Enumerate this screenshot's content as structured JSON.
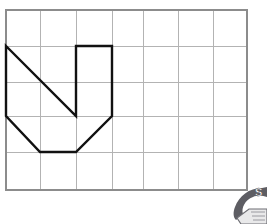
{
  "figure": {
    "title": "",
    "background_color": "#ffffff",
    "grid": {
      "name": "square-grid",
      "columns": 7,
      "rows": 5,
      "cell_width": 34.4,
      "cell_height": 36,
      "origin_x": 6,
      "origin_y": 10,
      "line_color": "#b3b3b3",
      "border_color": "#8c8c8c",
      "x_lines": [
        6,
        40,
        76,
        112,
        143,
        178,
        213,
        247
      ],
      "y_lines": [
        10,
        46,
        82,
        116,
        152,
        190
      ]
    },
    "shape": {
      "name": "letter-n-polygon",
      "description": "N-shaped outlined polygon drawn on grid",
      "stroke_color": "#111111",
      "stroke_width": 2.4,
      "fill": "none",
      "closed": true,
      "vertices_px": [
        [
          6,
          46
        ],
        [
          76,
          116
        ],
        [
          76,
          46
        ],
        [
          112,
          46
        ],
        [
          112,
          116
        ],
        [
          76,
          152
        ],
        [
          40,
          152
        ],
        [
          6,
          116
        ]
      ],
      "vertices_grid": [
        [
          0,
          1
        ],
        [
          2,
          3
        ],
        [
          2,
          1
        ],
        [
          3,
          1
        ],
        [
          3,
          3
        ],
        [
          2,
          4
        ],
        [
          1,
          4
        ],
        [
          0,
          3
        ]
      ]
    },
    "watermark": {
      "name": "corner-logo-watermark",
      "letter": "S",
      "color": "#6e6e74",
      "position": "bottom-right"
    }
  }
}
